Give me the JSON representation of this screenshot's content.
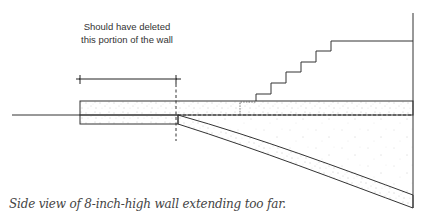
{
  "annotation": {
    "line1": "Should have deleted",
    "line2": "this portion of the wall"
  },
  "caption": "Side view of 8-inch-high wall extending too far.",
  "colors": {
    "line": "#333333",
    "speckle": "#888888",
    "background": "#ffffff"
  },
  "elements": {
    "ground_line": "ground-line",
    "wall": "8-inch-high wall (concrete)",
    "stairs": "stair-steps",
    "dimension": "deletion-extent-dimension",
    "cut_line": "dashed cut line"
  }
}
